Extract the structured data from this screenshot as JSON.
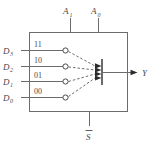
{
  "figure": {
    "type": "logic-diagram",
    "colors": {
      "wire": "#6b6b6b",
      "text": "#4a4a4a",
      "arrowhead": "#2b2b2b",
      "background": "#ffffff"
    }
  },
  "select_inputs": [
    {
      "label": "A",
      "subscript": "1",
      "name": "select-input-a1"
    },
    {
      "label": "A",
      "subscript": "0",
      "name": "select-input-a0"
    }
  ],
  "data_inputs": [
    {
      "label": "D",
      "subscript": "3",
      "code": "11",
      "name": "data-input-d3"
    },
    {
      "label": "D",
      "subscript": "2",
      "code": "10",
      "name": "data-input-d2"
    },
    {
      "label": "D",
      "subscript": "1",
      "code": "01",
      "name": "data-input-d1"
    },
    {
      "label": "D",
      "subscript": "0",
      "code": "00",
      "name": "data-input-d0"
    }
  ],
  "enable_input": {
    "label": "S",
    "active_low": true,
    "name": "enable-input-s-bar"
  },
  "output": {
    "label": "Y",
    "name": "output-y"
  }
}
